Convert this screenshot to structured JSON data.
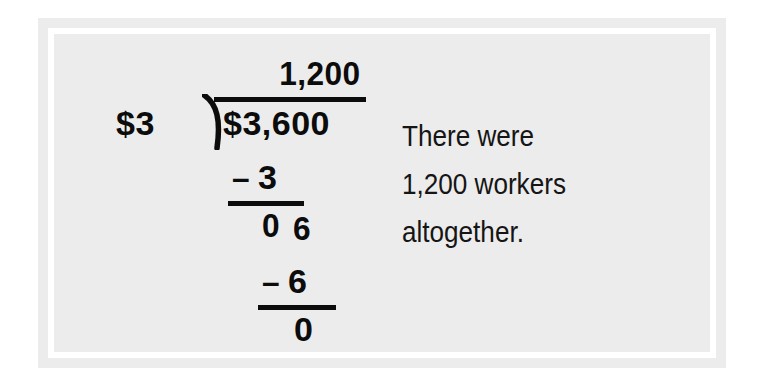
{
  "page": {
    "background_color": "#ffffff",
    "panel_color": "#ececec",
    "ring_color": "#ffffff",
    "ink_color": "#0c0c0c"
  },
  "division": {
    "operation": "long-division",
    "divisor": "$3",
    "dividend": "$3,600",
    "quotient": "1,200",
    "bracket_icon": "division-bracket-icon",
    "steps": [
      {
        "minus": "–",
        "value": "3"
      },
      {
        "partial": "0",
        "brought_down": "6"
      },
      {
        "minus": "–",
        "value": "6"
      },
      {
        "remainder": "0"
      }
    ],
    "step1_minus": "–",
    "step1_value": "3",
    "partial_zero": "0",
    "brought_down": "6",
    "step2_minus": "–",
    "step2_value": "6",
    "remainder": "0"
  },
  "answer": {
    "lines": [
      "There were",
      "1,200 workers",
      "altogether."
    ],
    "line1": "There were",
    "line2": "1,200 workers",
    "line3": "altogether."
  }
}
